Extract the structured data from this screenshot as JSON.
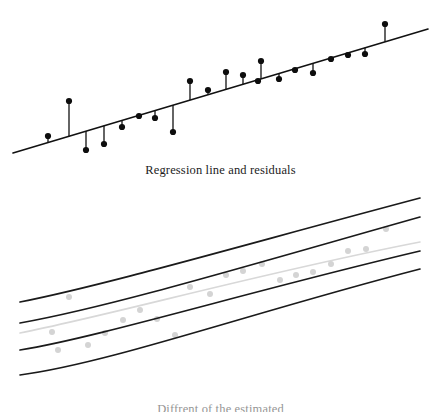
{
  "figure": {
    "background_color": "#ffffff",
    "width": 441,
    "height": 412
  },
  "panels": {
    "top": {
      "caption": "Regression line and residuals",
      "name": "regression-residuals-panel"
    },
    "bottom": {
      "caption": "Diffrent of the estimated",
      "name": "confidence-bands-panel"
    }
  },
  "colors": {
    "line": "#111111",
    "point": "#0d0d0d",
    "band": "#1a1a1a",
    "fit_light": "#d8d8d8",
    "point_light": "#d4d4d4",
    "text": "#1c1c1c"
  },
  "chart_data": [
    {
      "type": "scatter",
      "name": "regression-line-and-residuals",
      "title": "Regression line and residuals",
      "xlabel": "",
      "ylabel": "",
      "grid": false,
      "legend": null,
      "axis_visible": false,
      "xlim": [
        0,
        441
      ],
      "ylim": [
        0,
        160
      ],
      "regression_line": {
        "x1": 13,
        "y1": 153,
        "x2": 428,
        "y2": 29,
        "stroke_width": 1.6
      },
      "point_radius": 3.1,
      "residual_stroke_width": 1.3,
      "points": [
        {
          "x": 48,
          "y": 136,
          "fit_y": 142.5,
          "residual": 6.5
        },
        {
          "x": 69,
          "y": 101,
          "fit_y": 136.2,
          "residual": 35.2
        },
        {
          "x": 86,
          "y": 150,
          "fit_y": 131.1,
          "residual": -18.9
        },
        {
          "x": 104,
          "y": 144,
          "fit_y": 125.7,
          "residual": -18.3
        },
        {
          "x": 122,
          "y": 127,
          "fit_y": 120.4,
          "residual": -6.6
        },
        {
          "x": 139,
          "y": 116,
          "fit_y": 115.3,
          "residual": -0.7
        },
        {
          "x": 155,
          "y": 118,
          "fit_y": 110.5,
          "residual": -7.5
        },
        {
          "x": 173,
          "y": 132,
          "fit_y": 105.1,
          "residual": -26.9
        },
        {
          "x": 190,
          "y": 81,
          "fit_y": 100.0,
          "residual": 19.0
        },
        {
          "x": 208,
          "y": 90,
          "fit_y": 94.7,
          "residual": 4.7
        },
        {
          "x": 226,
          "y": 72,
          "fit_y": 89.3,
          "residual": 17.3
        },
        {
          "x": 243,
          "y": 75,
          "fit_y": 84.2,
          "residual": 9.2
        },
        {
          "x": 258,
          "y": 81,
          "fit_y": 79.7,
          "residual": -1.3
        },
        {
          "x": 261,
          "y": 61,
          "fit_y": 78.8,
          "residual": 17.8
        },
        {
          "x": 279,
          "y": 79,
          "fit_y": 73.5,
          "residual": -5.5
        },
        {
          "x": 295,
          "y": 70,
          "fit_y": 68.7,
          "residual": -1.3
        },
        {
          "x": 313,
          "y": 73,
          "fit_y": 63.3,
          "residual": -9.7
        },
        {
          "x": 331,
          "y": 59,
          "fit_y": 58.0,
          "residual": -1.0
        },
        {
          "x": 348,
          "y": 55,
          "fit_y": 52.9,
          "residual": -2.1
        },
        {
          "x": 365,
          "y": 54,
          "fit_y": 47.8,
          "residual": -6.2
        },
        {
          "x": 385,
          "y": 24,
          "fit_y": 41.8,
          "residual": 17.8
        }
      ]
    },
    {
      "type": "line",
      "name": "confidence-and-prediction-bands",
      "title": "Diffrent of the estimated",
      "xlabel": "",
      "ylabel": "",
      "grid": false,
      "legend": null,
      "axis_visible": false,
      "xlim": [
        0,
        441
      ],
      "ylim": [
        0,
        200
      ],
      "fit_line": {
        "name": "fitted-regression-line",
        "color": "#d8d8d8",
        "stroke_width": 1.6,
        "path": "M 20 148 C 120 128, 260 88, 420 57"
      },
      "bands": [
        {
          "name": "upper-prediction-band",
          "color": "#1a1a1a",
          "stroke_width": 1.7,
          "path": "M 20 117 C 110 99, 250 58, 420 13"
        },
        {
          "name": "upper-confidence-band",
          "color": "#1a1a1a",
          "stroke_width": 1.7,
          "path": "M 20 138 C 110 122, 250 80, 420 32"
        },
        {
          "name": "lower-confidence-band",
          "color": "#1a1a1a",
          "stroke_width": 1.7,
          "path": "M 20 165 C 100 152, 250 106, 420 66"
        },
        {
          "name": "lower-prediction-band",
          "color": "#1a1a1a",
          "stroke_width": 1.7,
          "path": "M 20 190 C 110 178, 250 128, 420 84"
        }
      ],
      "point_radius": 3.0,
      "points": [
        {
          "x": 69,
          "y": 112
        },
        {
          "x": 52,
          "y": 147
        },
        {
          "x": 58,
          "y": 165
        },
        {
          "x": 88,
          "y": 160
        },
        {
          "x": 105,
          "y": 148
        },
        {
          "x": 123,
          "y": 135
        },
        {
          "x": 140,
          "y": 125
        },
        {
          "x": 157,
          "y": 134
        },
        {
          "x": 175,
          "y": 150
        },
        {
          "x": 190,
          "y": 102
        },
        {
          "x": 210,
          "y": 109
        },
        {
          "x": 226,
          "y": 90
        },
        {
          "x": 243,
          "y": 86
        },
        {
          "x": 262,
          "y": 79
        },
        {
          "x": 280,
          "y": 95
        },
        {
          "x": 296,
          "y": 90
        },
        {
          "x": 313,
          "y": 87
        },
        {
          "x": 331,
          "y": 79
        },
        {
          "x": 348,
          "y": 66
        },
        {
          "x": 366,
          "y": 64
        },
        {
          "x": 386,
          "y": 44
        }
      ]
    }
  ]
}
